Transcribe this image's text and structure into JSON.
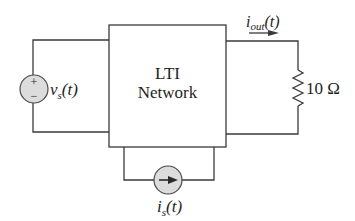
{
  "diagram": {
    "type": "circuit",
    "block": {
      "line1": "LTI",
      "line2": "Network"
    },
    "voltage_source": {
      "symbol": "v",
      "subscript": "s",
      "arg": "(t)",
      "plus": "+",
      "minus": "−"
    },
    "current_source": {
      "symbol": "i",
      "subscript": "s",
      "arg": "(t)"
    },
    "output_current": {
      "symbol": "i",
      "subscript": "out",
      "arg": "(t)"
    },
    "resistor": {
      "value": "10 Ω"
    },
    "colors": {
      "wire": "#3a3a3a",
      "source_fill": "#dcdcdc",
      "background": "#ffffff"
    }
  }
}
